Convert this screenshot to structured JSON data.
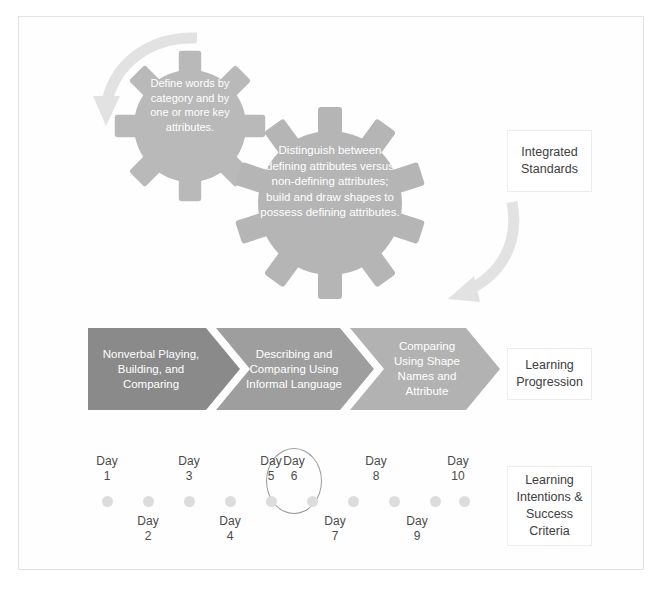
{
  "frame": {
    "label": "diagram-frame"
  },
  "captions": [
    {
      "id": "standards",
      "text": "Integrated Standards"
    },
    {
      "id": "progression",
      "text": "Learning Progression"
    },
    {
      "id": "intentions",
      "text": "Learning Intentions & Success Criteria"
    }
  ],
  "gears": [
    {
      "id": "gear-1",
      "text": "Define words by category and by one or more key attributes.",
      "color": "#b9b9b9",
      "teeth": 8
    },
    {
      "id": "gear-2",
      "text": "Distinguish between defining attributes versus non-defining attributes; build and draw shapes to possess defining attributes.",
      "color": "#b5b5b5",
      "teeth": 10
    }
  ],
  "arrows": [
    {
      "id": "arrow-left",
      "name": "curved-arrow-icon",
      "color": "#e2e2e2"
    },
    {
      "id": "arrow-right",
      "name": "curved-arrow-icon",
      "color": "#e2e2e2"
    }
  ],
  "progression": {
    "steps": [
      {
        "label": "Nonverbal Playing, Building, and Comparing",
        "color": "#8a8a8a"
      },
      {
        "label": "Describing and Comparing Using Informal Language",
        "color": "#9e9e9e"
      },
      {
        "label": "Comparing Using Shape Names and Attribute",
        "color": "#b2b2b2"
      }
    ]
  },
  "timeline": {
    "dot_color": "#dcdcdc",
    "highlight_color": "#9a9a9a",
    "highlighted_day": "6",
    "days": [
      {
        "word": "Day",
        "num": "1",
        "position": "top"
      },
      {
        "word": "Day",
        "num": "2",
        "position": "bottom"
      },
      {
        "word": "Day",
        "num": "3",
        "position": "top"
      },
      {
        "word": "Day",
        "num": "4",
        "position": "bottom"
      },
      {
        "word": "Day",
        "num": "5",
        "position": "top"
      },
      {
        "word": "Day",
        "num": "6",
        "position": "top"
      },
      {
        "word": "Day",
        "num": "7",
        "position": "bottom"
      },
      {
        "word": "Day",
        "num": "8",
        "position": "top"
      },
      {
        "word": "Day",
        "num": "9",
        "position": "bottom"
      },
      {
        "word": "Day",
        "num": "10",
        "position": "top"
      }
    ]
  }
}
